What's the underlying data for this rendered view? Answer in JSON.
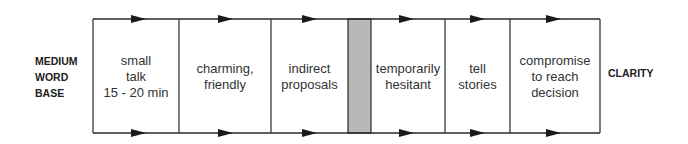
{
  "left_label": [
    "MEDIUM",
    "WORD",
    "BASE"
  ],
  "right_label": "CLARITY",
  "colors": {
    "line": "#2a2a2a",
    "separator_fill": "#b8b8b8"
  },
  "stages": [
    {
      "lines": [
        "small",
        "talk",
        "15 - 20 min"
      ],
      "x": 93,
      "w": 86
    },
    {
      "lines": [
        "charming,",
        "friendly"
      ],
      "x": 179,
      "w": 92
    },
    {
      "lines": [
        "indirect",
        "proposals"
      ],
      "x": 271,
      "w": 77
    },
    {
      "lines": [
        "temporarily",
        "hesitant"
      ],
      "x": 371,
      "w": 74
    },
    {
      "lines": [
        "tell",
        "stories"
      ],
      "x": 445,
      "w": 65
    },
    {
      "lines": [
        "compromise",
        "to reach",
        "decision"
      ],
      "x": 510,
      "w": 90
    }
  ],
  "separator": {
    "x": 348,
    "w": 23
  }
}
